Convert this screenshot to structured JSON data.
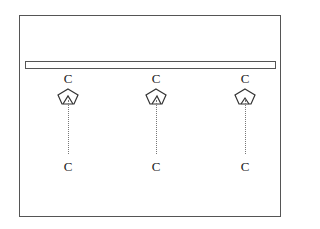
{
  "diagram": {
    "type": "schematic",
    "frame": {
      "stroke": "#555555"
    },
    "bar": {
      "label": ""
    },
    "columns": [
      {
        "top_label": "C",
        "bottom_label": "C",
        "center_x": 68,
        "icon": "pentagon-with-wedge-icon"
      },
      {
        "top_label": "C",
        "bottom_label": "C",
        "center_x": 156,
        "icon": "pentagon-with-wedge-icon"
      },
      {
        "top_label": "C",
        "bottom_label": "C",
        "center_x": 245,
        "icon": "pentagon-with-wedge-icon"
      }
    ]
  }
}
